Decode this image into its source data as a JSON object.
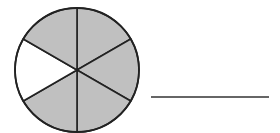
{
  "figure": {
    "circle": {
      "cx": 77,
      "cy": 70,
      "r": 62,
      "total_parts": 6,
      "shaded_parts": 5,
      "unshaded_sector_indices": [
        4
      ],
      "shade_color": "#c0c0c0",
      "unshaded_color": "#ffffff",
      "stroke_color": "#222222"
    },
    "answer_line": {
      "x1": 151,
      "x2": 269,
      "y": 97,
      "color": "#333333"
    }
  }
}
